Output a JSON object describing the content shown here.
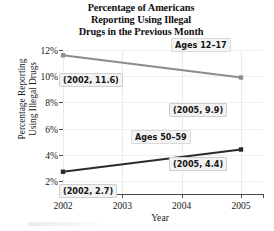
{
  "chart_data": {
    "type": "line",
    "title": "Percentage of Americans Reporting Using Illegal Drugs in the Previous Month",
    "title_lines": [
      "Percentage of Americans",
      "Reporting Using Illegal",
      "Drugs in the Previous Month"
    ],
    "xlabel": "Year",
    "ylabel": "Percentage Reporting Using Illegal Drugs",
    "ylabel_lines": [
      "Percentage Reporting",
      "Using Illegal Drugs"
    ],
    "x": [
      2002,
      2005
    ],
    "xlim": [
      2002,
      2005
    ],
    "ylim": [
      1,
      12
    ],
    "xticks": [
      "2002",
      "2003",
      "2004",
      "2005"
    ],
    "xtick_values": [
      2002,
      2003,
      2004,
      2005
    ],
    "yticks": [
      "2%",
      "4%",
      "6%",
      "8%",
      "10%",
      "12%"
    ],
    "ytick_values": [
      2,
      4,
      6,
      8,
      10,
      12
    ],
    "grid": "light vertical gridlines at each year",
    "legend_position": "inline series labels",
    "series": [
      {
        "name": "Ages 12–17",
        "label": "Ages 12–17",
        "color": "#8c8c8c",
        "values": [
          11.6,
          9.9
        ],
        "point_labels": [
          "(2002, 11.6)",
          "(2005, 9.9)"
        ]
      },
      {
        "name": "Ages 50–59",
        "label": "Ages 50–59",
        "color": "#2b2b2b",
        "values": [
          2.7,
          4.4
        ],
        "point_labels": [
          "(2002, 2.7)",
          "(2005, 4.4)"
        ]
      }
    ],
    "annotations": [
      {
        "text": "(2002, 11.6)",
        "series": "Ages 12–17",
        "x": 2002,
        "y": 11.6
      },
      {
        "text": "(2005, 9.9)",
        "series": "Ages 12–17",
        "x": 2005,
        "y": 9.9
      },
      {
        "text": "(2002, 2.7)",
        "series": "Ages 50–59",
        "x": 2002,
        "y": 2.7
      },
      {
        "text": "(2005, 4.4)",
        "series": "Ages 50–59",
        "x": 2005,
        "y": 4.4
      }
    ]
  },
  "colors": {
    "axis": "#4a4a4a",
    "grid": "#e9e9e9",
    "series_teen": "#8c8c8c",
    "series_older": "#2b2b2b",
    "text": "#1a1a1a",
    "label_background": "#f2f2f2"
  }
}
